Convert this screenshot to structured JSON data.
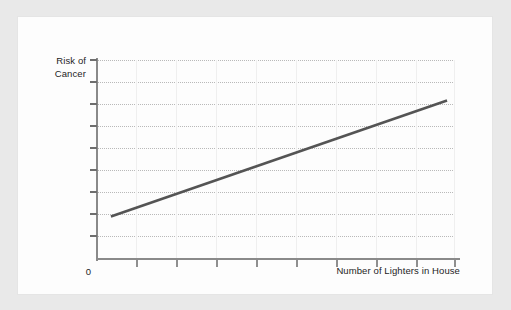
{
  "figure": {
    "background_color": "#e9e9e9",
    "paper_color": "#fdfdfd",
    "y_axis_label": "Risk of\nCancer",
    "origin_label": "0",
    "x_axis_label": "Number of Lighters in House"
  },
  "chart_data": {
    "type": "line",
    "title": "",
    "subtitle": "",
    "xlabel": "Number of Lighters in House",
    "ylabel": "Risk of Cancer",
    "annotations": [],
    "legend": [],
    "legend_position": "none",
    "grid": true,
    "grid_style": "dotted horizontal gridlines, faint solid vertical gridlines",
    "xlim": [
      0,
      9
    ],
    "ylim": [
      0,
      10
    ],
    "x_tick_labels": [
      "",
      "",
      "",
      "",
      "",
      "",
      "",
      "",
      ""
    ],
    "y_tick_labels": [
      "",
      "",
      "",
      "",
      "",
      "",
      "",
      "",
      "",
      ""
    ],
    "x_tick_count": 9,
    "y_tick_count": 10,
    "origin_tick_label": "0",
    "line_color": "#545454",
    "line_width_px": 2.6,
    "series": [
      {
        "name": "Risk of Cancer",
        "x": [
          0.35,
          8.8
        ],
        "values": [
          2.1,
          7.95
        ],
        "description": "straight positive-sloping line rising left to right"
      }
    ]
  }
}
